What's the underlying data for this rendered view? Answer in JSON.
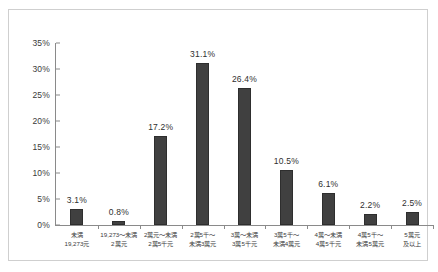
{
  "chart_data": {
    "type": "bar",
    "title": "",
    "subtitle": "",
    "xlabel": "",
    "ylabel": "",
    "ylim": [
      0,
      35
    ],
    "yticks": [
      "0%",
      "5%",
      "10%",
      "15%",
      "20%",
      "25%",
      "30%",
      "35%"
    ],
    "ytick_values": [
      0,
      5,
      10,
      15,
      20,
      25,
      30,
      35
    ],
    "grid": false,
    "legend": false,
    "legend_position": "none",
    "categories": [
      "未満\n19,273元",
      "19,273〜未満\n2萬元",
      "2萬元〜未満\n2萬5千元",
      "2萬5千〜\n未満3萬元",
      "3萬〜未満\n3萬5千元",
      "3萬5千〜\n未満4萬元",
      "4萬〜未満\n4萬5千元",
      "4萬5千〜\n未満5萬元",
      "5萬元\n及以上"
    ],
    "category_lines": [
      [
        "未満",
        "19,273元"
      ],
      [
        "19,273〜未満",
        "2萬元"
      ],
      [
        "2萬元〜未満",
        "2萬5千元"
      ],
      [
        "2萬5千〜",
        "未満3萬元"
      ],
      [
        "3萬〜未満",
        "3萬5千元"
      ],
      [
        "3萬5千〜",
        "未満4萬元"
      ],
      [
        "4萬〜未満",
        "4萬5千元"
      ],
      [
        "4萬5千〜",
        "未満5萬元"
      ],
      [
        "5萬元",
        "及以上"
      ]
    ],
    "values": [
      3.1,
      0.8,
      17.2,
      31.1,
      26.4,
      10.5,
      6.1,
      2.2,
      2.5
    ],
    "value_labels": [
      "3.1%",
      "0.8%",
      "17.2%",
      "31.1%",
      "26.4%",
      "10.5%",
      "6.1%",
      "2.2%",
      "2.5%"
    ],
    "bar_color": "#404040",
    "axis_color": "#8a8a8a",
    "frame_color": "#cfcfcf",
    "background_color": "#ffffff",
    "text_color": "#3a3a3a"
  }
}
